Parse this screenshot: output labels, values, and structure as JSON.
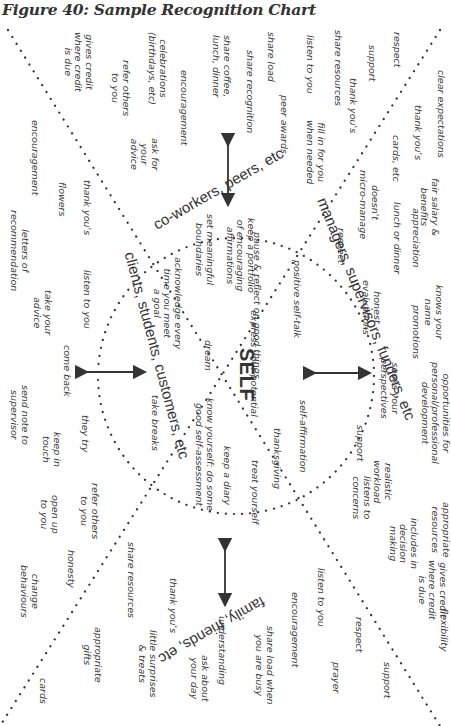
{
  "figure": {
    "title": "Figure 40: Sample Recognition Chart"
  },
  "center": {
    "label": "SELF"
  },
  "groups": {
    "coworkers": "co-workers, peers, etc",
    "managers": "managers, supervisors, funders, etc",
    "family": "family, friends, etc",
    "clients": "clients, students, customers, etc"
  },
  "self_items": [
    "keep a portfolio\nof encouraging\naffirmations",
    "pause & reflect on good things",
    "positive self-talk",
    "express your potential",
    "set meaningful\nboundaries",
    "acknowledge every\ntime you meet\na goal",
    "dream",
    "know yourself: do some\ngood self-assessment",
    "self-affirmation",
    "thanksgiving",
    "keep a diary",
    "treat yourself",
    "take breaks"
  ],
  "coworker_items": [
    "share coffee,\nlunch, dinner",
    "celebrations\n(birthdays, etc)",
    "gives credit\nwhere credit\nis due",
    "encouragement",
    "refer others\nto you",
    "ask for\nyour\nadvice",
    "share load",
    "share recognition",
    "peer awards",
    "respect",
    "support",
    "share resources",
    "listen to you",
    "thank you's",
    "fill in for you\nwhen needed"
  ],
  "manager_items": [
    "clear expectations",
    "thank you's",
    "cards, etc",
    "micro-manage",
    "doesn't",
    "respect",
    "fair salary &\nbenefits",
    "appreciation",
    "lunch or dinner",
    "honest\nevaluations",
    "knows your\nname",
    "promotions",
    "seeks your\nperspectives",
    "opportunities for\npersonal/professional\ndevelopment",
    "realistic\nworkload",
    "support",
    "listens to\nconcerns",
    "appropriate\nresources",
    "includes in\ndecision\nmaking",
    "gives credit\nwhere credit\nis due",
    "flexibility"
  ],
  "family_items": [
    "listen to you",
    "encouragement",
    "respect",
    "prayer",
    "support",
    "share load when\nyou are busy",
    "understanding",
    "ask about\nyour day",
    "thank you's",
    "little surprises\n& treats",
    "share resources",
    "appropriate\ngifts",
    "honesty",
    "change\nbehaviours",
    "cards",
    "open up\nto you",
    "refer others\nto you"
  ],
  "client_items": [
    "encouragement",
    "flowers",
    "thank you's",
    "letters of\nrecommendation",
    "listen to you",
    "take your\nadvice",
    "come back",
    "send note to\nsupervisor",
    "they try",
    "keep in\ntouch"
  ]
}
